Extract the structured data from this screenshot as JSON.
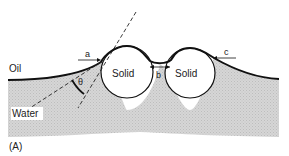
{
  "figure": {
    "panel_label": "(A)",
    "labels": {
      "oil": "Oil",
      "water": "Water",
      "solid_left": "Solid",
      "solid_right": "Solid",
      "angle": "θ",
      "point_a": "a",
      "point_b": "b",
      "point_c": "c"
    },
    "colors": {
      "water_fill": "#d4d4d4",
      "interface": "#111111",
      "solid_fill": "#ffffff",
      "background": "#ffffff"
    }
  }
}
